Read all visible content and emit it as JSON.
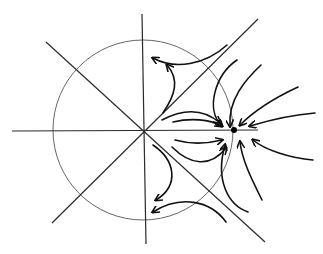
{
  "diagram": {
    "type": "phase-portrait-sketch",
    "text_labels": [],
    "colors": {
      "background": "#ffffff",
      "ink": "#111111",
      "circle": "#555555"
    },
    "origin": {
      "x": 143,
      "y": 130
    },
    "circle": {
      "cx": 143,
      "cy": 130,
      "r": 90
    },
    "fixed_point": {
      "x": 234,
      "y": 130,
      "r": 3
    },
    "axes": [
      {
        "name": "horizontal-axis",
        "x1": 12,
        "y1": 131,
        "x2": 258,
        "y2": 130
      },
      {
        "name": "vertical-axis",
        "x1": 142,
        "y1": 14,
        "x2": 146,
        "y2": 244
      },
      {
        "name": "diagonal-rising",
        "x1": 52,
        "y1": 223,
        "x2": 258,
        "y2": 19
      },
      {
        "name": "diagonal-falling",
        "x1": 46,
        "y1": 42,
        "x2": 265,
        "y2": 242
      }
    ],
    "flow_lines": [
      {
        "name": "flow-top-left-out",
        "d": "M227,45 C205,65 175,70 153,58",
        "arrow_at": "end"
      },
      {
        "name": "flow-upper-rising",
        "d": "M163,113 C175,95 180,80 167,65",
        "arrow_at": "end"
      },
      {
        "name": "flow-upper-band",
        "d": "M237,60 C215,75 205,110 222,126",
        "arrow_at": "end"
      },
      {
        "name": "flow-upper-band-2",
        "d": "M261,65 C245,80 228,100 230,126",
        "arrow_at": "end"
      },
      {
        "name": "flow-upper-right-in",
        "d": "M298,87 C270,100 250,115 240,125",
        "arrow_at": "end"
      },
      {
        "name": "flow-right-in",
        "d": "M315,113 C290,115 270,120 250,126",
        "arrow_at": "end"
      },
      {
        "name": "flow-mid-upper",
        "d": "M162,120 C185,108 205,110 220,123",
        "arrow_at": "end"
      },
      {
        "name": "flow-near-axis-above",
        "d": "M173,122 C190,118 210,119 221,126",
        "arrow_at": "end"
      },
      {
        "name": "flow-near-axis-below",
        "d": "M175,140 C193,145 210,143 222,140",
        "arrow_at": "end"
      },
      {
        "name": "flow-mid-lower",
        "d": "M172,147 C190,165 210,168 226,148",
        "arrow_at": "end"
      },
      {
        "name": "flow-lower-band",
        "d": "M248,212 C228,205 215,180 225,145",
        "arrow_at": "end"
      },
      {
        "name": "flow-lower-right-in",
        "d": "M262,200 C252,180 242,160 240,142",
        "arrow_at": "end"
      },
      {
        "name": "flow-right-lower-in",
        "d": "M313,160 C290,158 265,150 253,140",
        "arrow_at": "end"
      },
      {
        "name": "flow-lower-descending",
        "d": "M153,145 C175,160 180,185 156,200",
        "arrow_at": "end"
      },
      {
        "name": "flow-bottom-left-out",
        "d": "M226,222 C210,200 180,195 153,212",
        "arrow_at": "end"
      }
    ]
  }
}
